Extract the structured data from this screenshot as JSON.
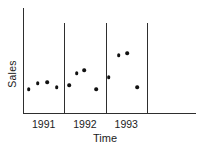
{
  "chart_data": {
    "type": "scatter",
    "xlabel": "Time",
    "ylabel": "Sales",
    "years": [
      "1991",
      "1992",
      "1993"
    ],
    "series": [
      {
        "name": "1991",
        "x": [
          1991.14,
          1991.36,
          1991.58,
          1991.82
        ],
        "y": [
          25,
          31,
          32,
          27
        ]
      },
      {
        "name": "1992",
        "x": [
          1992.12,
          1992.3,
          1992.48,
          1992.78
        ],
        "y": [
          29,
          41,
          44,
          25
        ]
      },
      {
        "name": "1993",
        "x": [
          1993.08,
          1993.32,
          1993.53,
          1993.77
        ],
        "y": [
          37,
          59,
          61,
          27
        ]
      }
    ],
    "xlim": [
      1991,
      1995.19
    ],
    "ylim": [
      0,
      106
    ],
    "year_dividers": [
      1992,
      1993,
      1994
    ],
    "grid": false,
    "legend": "none",
    "point_color": "#111111",
    "axis_color": "#2e2e2e"
  }
}
